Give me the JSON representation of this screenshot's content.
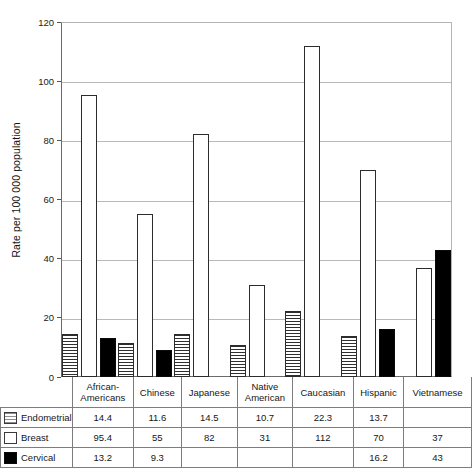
{
  "chart_data": {
    "type": "bar",
    "title": "",
    "xlabel": "",
    "ylabel": "Rate per 100 000 population",
    "ylim": [
      0,
      120
    ],
    "yticks": [
      0,
      20,
      40,
      60,
      80,
      100,
      120
    ],
    "grid": true,
    "legend_position": "table-left",
    "categories": [
      "African-Americans",
      "Chinese",
      "Japanese",
      "Native American",
      "Caucasian",
      "Hispanic",
      "Vietnamese"
    ],
    "category_lines": [
      [
        "African-",
        "Americans"
      ],
      [
        "Chinese"
      ],
      [
        "Japanese"
      ],
      [
        "Native",
        "American"
      ],
      [
        "Caucasian"
      ],
      [
        "Hispanic"
      ],
      [
        "Vietnamese"
      ]
    ],
    "series": [
      {
        "name": "Endometrial",
        "pattern": "horizontal-stripes",
        "values": [
          14.4,
          11.6,
          14.5,
          10.7,
          22.3,
          13.7,
          null
        ],
        "labels": [
          "14.4",
          "11.6",
          "14.5",
          "10.7",
          "22.3",
          "13.7",
          ""
        ]
      },
      {
        "name": "Breast",
        "pattern": "white-outline",
        "values": [
          95.4,
          55,
          82,
          31,
          112,
          70,
          37
        ],
        "labels": [
          "95.4",
          "55",
          "82",
          "31",
          "112",
          "70",
          "37"
        ]
      },
      {
        "name": "Cervical",
        "pattern": "solid-black",
        "values": [
          13.2,
          9.3,
          null,
          null,
          null,
          16.2,
          43
        ],
        "labels": [
          "13.2",
          "9.3",
          "",
          "",
          "",
          "16.2",
          "43"
        ]
      }
    ]
  },
  "colors": {
    "axis": "#6a6a6a",
    "grid": "#b9b9b9",
    "bar_outline": "#2c2c2c",
    "cervical_fill": "#000000",
    "table_border": "#7d7d7d",
    "text": "#161616"
  },
  "ytick_labels": [
    "0",
    "20",
    "40",
    "60",
    "80",
    "100",
    "120"
  ]
}
